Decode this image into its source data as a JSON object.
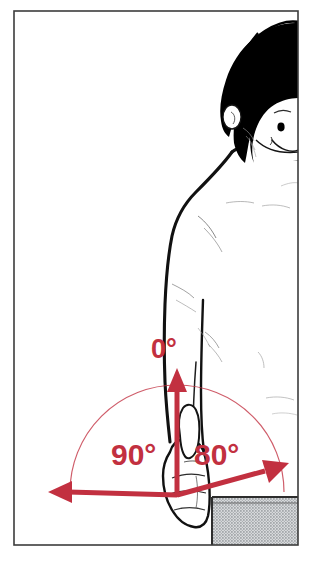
{
  "illustration": {
    "title": "Shoulder rotation range of motion",
    "subject": "cartoon human figure, upper body, right side view, arm hanging down with closed fist",
    "style": "black ink line drawing with red angle annotations",
    "frame": {
      "border_color": "#3a3a3a",
      "background_color": "#ffffff",
      "left": 13,
      "top": 10,
      "right": 298,
      "bottom": 545
    }
  },
  "colors": {
    "annotation_red": "#C23040",
    "arc_red": "#C23040",
    "ink_black": "#111111",
    "hair_black": "#000000",
    "shorts_gray": "#b9bcbe",
    "skin_white": "#ffffff"
  },
  "annotations": {
    "neutral": {
      "label": "0°",
      "value": 0,
      "unit": "degrees",
      "direction": "up",
      "description": "neutral starting position, arrow pointing upward from fist"
    },
    "left_rotation": {
      "label": "90°",
      "value": 90,
      "unit": "degrees",
      "direction": "left",
      "description": "external rotation, arrow pointing left along horizontal baseline"
    },
    "right_rotation": {
      "label": "80°",
      "value": 80,
      "unit": "degrees",
      "direction": "right",
      "description": "internal rotation, arrow pointing up and to the right"
    },
    "arc": {
      "description": "thin semicircular arc spanning the full range of motion",
      "span_degrees": 170
    }
  },
  "body_parts": {
    "hair": "black bowl-cut hair",
    "ear": "visible left ear",
    "eye": "single visible eye",
    "mouth": "smiling mouth",
    "neck": "neck contour",
    "shoulder": "shoulder curve",
    "arm": "arm hanging vertically at side",
    "hand": "closed fist with thumb pointing up",
    "shorts": "gray halftone textured shorts"
  }
}
